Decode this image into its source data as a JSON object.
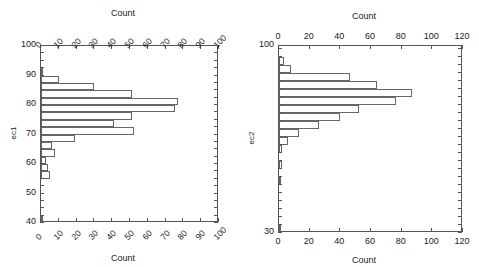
{
  "figure": {
    "background": "#ffffff",
    "line_color": "#666666",
    "axis_color": "#555555"
  },
  "chart_data": [
    {
      "type": "bar",
      "orientation": "horizontal",
      "title": "",
      "xlabel": "Count",
      "xlabel_top": "Count",
      "ylabel": "ec1",
      "xlim": [
        0,
        100
      ],
      "ylim": [
        40,
        100
      ],
      "xticks": [
        0,
        10,
        20,
        30,
        40,
        50,
        60,
        70,
        80,
        90,
        100
      ],
      "xticklabels": [
        "0",
        "10",
        "20",
        "30",
        "40",
        "50",
        "60",
        "70",
        "80",
        "90",
        "100"
      ],
      "xticklabel_rotation": -45,
      "yticks": [
        40,
        50,
        60,
        70,
        80,
        90,
        100
      ],
      "yticklabels": [
        "40",
        "50",
        "60",
        "70",
        "80",
        "90",
        "100"
      ],
      "grid": false,
      "legend": false,
      "bin_width": 2.5,
      "bins": [
        {
          "lo": 90.0,
          "hi": 92.5,
          "count": 1
        },
        {
          "lo": 87.5,
          "hi": 90.0,
          "count": 10
        },
        {
          "lo": 85.0,
          "hi": 87.5,
          "count": 30
        },
        {
          "lo": 82.5,
          "hi": 85.0,
          "count": 51
        },
        {
          "lo": 80.0,
          "hi": 82.5,
          "count": 77
        },
        {
          "lo": 77.5,
          "hi": 80.0,
          "count": 75
        },
        {
          "lo": 75.0,
          "hi": 77.5,
          "count": 51
        },
        {
          "lo": 72.5,
          "hi": 75.0,
          "count": 41
        },
        {
          "lo": 70.0,
          "hi": 72.5,
          "count": 52
        },
        {
          "lo": 67.5,
          "hi": 70.0,
          "count": 19
        },
        {
          "lo": 65.0,
          "hi": 67.5,
          "count": 6
        },
        {
          "lo": 62.5,
          "hi": 65.0,
          "count": 8
        },
        {
          "lo": 60.0,
          "hi": 62.5,
          "count": 3
        },
        {
          "lo": 57.5,
          "hi": 60.0,
          "count": 4
        },
        {
          "lo": 55.0,
          "hi": 57.5,
          "count": 5
        },
        {
          "lo": 40.0,
          "hi": 42.5,
          "count": 1
        }
      ]
    },
    {
      "type": "bar",
      "orientation": "horizontal",
      "title": "",
      "xlabel": "Count",
      "xlabel_top": "Count",
      "ylabel": "ec2",
      "xlim": [
        0,
        120
      ],
      "ylim": [
        30,
        100
      ],
      "xticks": [
        0,
        20,
        40,
        60,
        80,
        100,
        120
      ],
      "xticklabels": [
        "0",
        "20",
        "40",
        "60",
        "80",
        "100",
        "120"
      ],
      "xticklabel_rotation": 0,
      "yticks": [
        30,
        100
      ],
      "yticklabels": [
        "30",
        "100"
      ],
      "grid": false,
      "legend": false,
      "bin_width": 3.0,
      "bins": [
        {
          "lo": 93.0,
          "hi": 96.0,
          "count": 3
        },
        {
          "lo": 90.0,
          "hi": 93.0,
          "count": 8
        },
        {
          "lo": 87.0,
          "hi": 90.0,
          "count": 46
        },
        {
          "lo": 84.0,
          "hi": 87.0,
          "count": 64
        },
        {
          "lo": 81.0,
          "hi": 84.0,
          "count": 87
        },
        {
          "lo": 78.0,
          "hi": 81.0,
          "count": 76
        },
        {
          "lo": 75.0,
          "hi": 78.0,
          "count": 52
        },
        {
          "lo": 72.0,
          "hi": 75.0,
          "count": 40
        },
        {
          "lo": 69.0,
          "hi": 72.0,
          "count": 26
        },
        {
          "lo": 66.0,
          "hi": 69.0,
          "count": 13
        },
        {
          "lo": 63.0,
          "hi": 66.0,
          "count": 6
        },
        {
          "lo": 60.0,
          "hi": 63.0,
          "count": 2
        },
        {
          "lo": 54.0,
          "hi": 57.0,
          "count": 2
        },
        {
          "lo": 48.0,
          "hi": 51.0,
          "count": 1
        },
        {
          "lo": 30.0,
          "hi": 33.0,
          "count": 1
        }
      ]
    }
  ],
  "panels": {
    "left": {
      "ylabel": "ec1",
      "top_title": "Count",
      "bottom_title": "Count"
    },
    "right": {
      "ylabel": "ec2",
      "top_title": "Count",
      "bottom_title": "Count"
    }
  }
}
